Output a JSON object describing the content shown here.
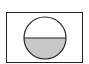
{
  "figure": {
    "colors": {
      "stroke": "#222222",
      "fill_lower_half": "#c8c8c8",
      "background": "#ffffff"
    }
  }
}
